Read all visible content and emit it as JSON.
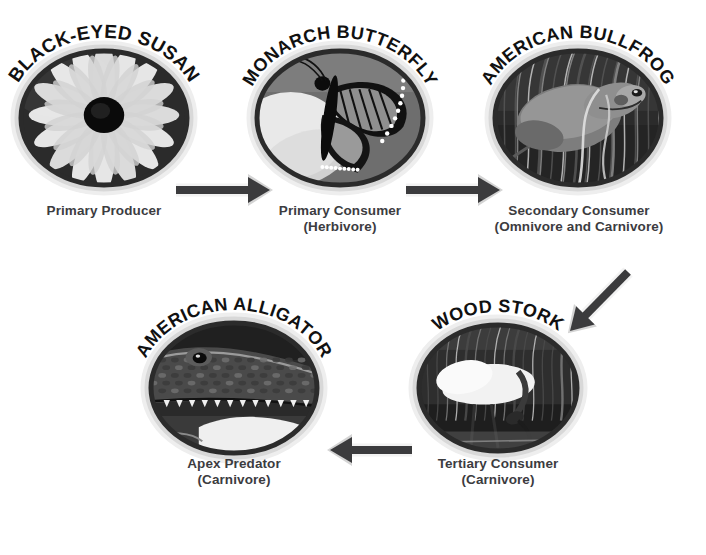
{
  "diagram": {
    "background_color": "#ffffff",
    "caption_color": "#3c3c3f",
    "arrow_color": "#3b3b3d",
    "ring_outer_color": "#d8d8d8",
    "ring_inner_color": "#2b2b2b"
  },
  "nodes": [
    {
      "id": "black-eyed-susan",
      "species": "BLACK-EYED SUSAN",
      "role": "Primary Producer",
      "role_detail": "",
      "image": "flower-photo",
      "cx": 104,
      "cy": 118,
      "rx": 88,
      "ry": 72,
      "caption_x": 14,
      "caption_y": 203,
      "caption_w": 180,
      "arc_rx": 95,
      "arc_ry": 80,
      "arc_start": 196,
      "arc_end": 344,
      "font_size": 19
    },
    {
      "id": "monarch-butterfly",
      "species": "MONARCH BUTTERFLY",
      "role": "Primary Consumer",
      "role_detail": "(Herbivore)",
      "image": "butterfly-photo",
      "cx": 340,
      "cy": 118,
      "rx": 88,
      "ry": 72,
      "caption_x": 250,
      "caption_y": 203,
      "caption_w": 180,
      "arc_rx": 95,
      "arc_ry": 80,
      "arc_start": 196,
      "arc_end": 344,
      "font_size": 18
    },
    {
      "id": "american-bullfrog",
      "species": "AMERICAN BULLFROG",
      "role": "Secondary Consumer",
      "role_detail": "(Omnivore and Carnivore)",
      "image": "bullfrog-photo",
      "cx": 578,
      "cy": 118,
      "rx": 88,
      "ry": 72,
      "caption_x": 468,
      "caption_y": 203,
      "caption_w": 222,
      "arc_rx": 95,
      "arc_ry": 80,
      "arc_start": 196,
      "arc_end": 344,
      "font_size": 18
    },
    {
      "id": "american-alligator",
      "species": "AMERICAN ALLIGATOR",
      "role": "Apex Predator",
      "role_detail": "(Carnivore)",
      "image": "alligator-photo",
      "cx": 234,
      "cy": 388,
      "rx": 88,
      "ry": 70,
      "caption_x": 144,
      "caption_y": 456,
      "caption_w": 180,
      "arc_rx": 95,
      "arc_ry": 78,
      "arc_start": 196,
      "arc_end": 344,
      "font_size": 18
    },
    {
      "id": "wood-stork",
      "species": "WOOD STORK",
      "role": "Tertiary Consumer",
      "role_detail": "(Carnivore)",
      "image": "stork-photo",
      "cx": 498,
      "cy": 388,
      "rx": 84,
      "ry": 68,
      "caption_x": 408,
      "caption_y": 456,
      "caption_w": 180,
      "arc_rx": 91,
      "arc_ry": 76,
      "arc_start": 204,
      "arc_end": 336,
      "font_size": 18
    }
  ],
  "arrows": [
    {
      "id": "arrow-susan-to-butterfly",
      "from": "black-eyed-susan",
      "to": "monarch-butterfly",
      "direction": "right",
      "x1": 176,
      "y1": 190,
      "x2": 270,
      "y2": 190
    },
    {
      "id": "arrow-butterfly-to-bullfrog",
      "from": "monarch-butterfly",
      "to": "american-bullfrog",
      "direction": "right",
      "x1": 406,
      "y1": 190,
      "x2": 500,
      "y2": 190
    },
    {
      "id": "arrow-bullfrog-to-stork",
      "from": "american-bullfrog",
      "to": "wood-stork",
      "direction": "down-left",
      "x1": 628,
      "y1": 272,
      "x2": 570,
      "y2": 331
    },
    {
      "id": "arrow-stork-to-alligator",
      "from": "wood-stork",
      "to": "american-alligator",
      "direction": "left",
      "x1": 412,
      "y1": 450,
      "x2": 330,
      "y2": 450
    }
  ]
}
